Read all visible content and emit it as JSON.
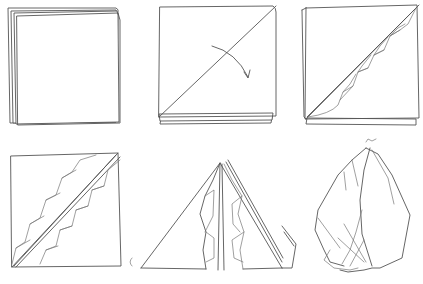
{
  "steps": [
    {
      "step": 1,
      "description": "Folded square napkin, open corners at top-left"
    },
    {
      "step": 2,
      "description": "Fold diagonally from bottom-left to top-right",
      "icon": "curved-arrow-icon"
    },
    {
      "step": 3,
      "description": "Pleat along the diagonal fold"
    },
    {
      "step": 4,
      "description": "Pleats on both sides of the diagonal"
    },
    {
      "step": 5,
      "description": "Fold into a triangle with pleats standing in the center"
    },
    {
      "step": 6,
      "description": "Finished fanned napkin shape"
    }
  ],
  "colors": {
    "line": "#555555",
    "background": "#ffffff"
  }
}
